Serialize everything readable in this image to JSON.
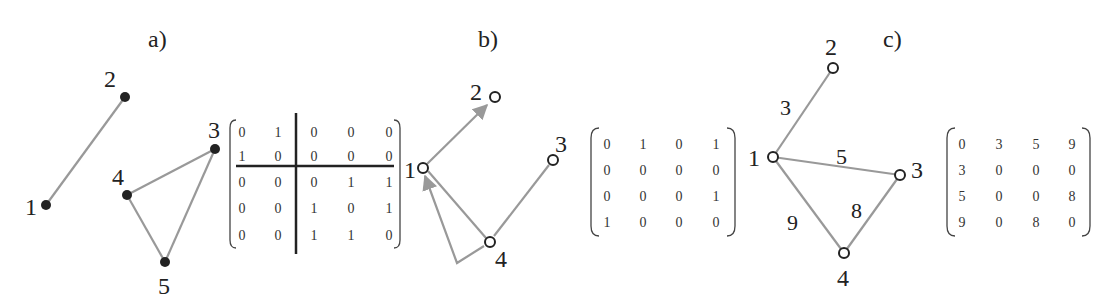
{
  "panels": [
    {
      "id": "a",
      "label": "a)",
      "graph_type": "undirected",
      "nodes": [
        {
          "id": "1",
          "label": "1"
        },
        {
          "id": "2",
          "label": "2"
        },
        {
          "id": "3",
          "label": "3"
        },
        {
          "id": "4",
          "label": "4"
        },
        {
          "id": "5",
          "label": "5"
        }
      ],
      "edges": [
        [
          "1",
          "2"
        ],
        [
          "4",
          "3"
        ],
        [
          "4",
          "5"
        ],
        [
          "3",
          "5"
        ]
      ],
      "matrix": [
        [
          "0",
          "1",
          "0",
          "0",
          "0"
        ],
        [
          "1",
          "0",
          "0",
          "0",
          "0"
        ],
        [
          "0",
          "0",
          "0",
          "1",
          "1"
        ],
        [
          "0",
          "0",
          "1",
          "0",
          "1"
        ],
        [
          "0",
          "0",
          "1",
          "1",
          "0"
        ]
      ],
      "matrix_note": "block-partitioned after row 2 and column 2"
    },
    {
      "id": "b",
      "label": "b)",
      "graph_type": "directed",
      "nodes": [
        {
          "id": "1",
          "label": "1"
        },
        {
          "id": "2",
          "label": "2"
        },
        {
          "id": "3",
          "label": "3"
        },
        {
          "id": "4",
          "label": "4"
        }
      ],
      "edges": [
        [
          "1",
          "2"
        ],
        [
          "1",
          "4"
        ],
        [
          "3",
          "4"
        ],
        [
          "4",
          "1"
        ]
      ],
      "matrix": [
        [
          "0",
          "1",
          "0",
          "1"
        ],
        [
          "0",
          "0",
          "0",
          "0"
        ],
        [
          "0",
          "0",
          "0",
          "1"
        ],
        [
          "1",
          "0",
          "0",
          "0"
        ]
      ]
    },
    {
      "id": "c",
      "label": "c)",
      "graph_type": "weighted",
      "nodes": [
        {
          "id": "1",
          "label": "1"
        },
        {
          "id": "2",
          "label": "2"
        },
        {
          "id": "3",
          "label": "3"
        },
        {
          "id": "4",
          "label": "4"
        }
      ],
      "edges": [
        {
          "from": "1",
          "to": "2",
          "weight": "3"
        },
        {
          "from": "1",
          "to": "3",
          "weight": "5"
        },
        {
          "from": "1",
          "to": "4",
          "weight": "9"
        },
        {
          "from": "3",
          "to": "4",
          "weight": "8"
        }
      ],
      "matrix": [
        [
          "0",
          "3",
          "5",
          "9"
        ],
        [
          "3",
          "0",
          "0",
          "0"
        ],
        [
          "5",
          "0",
          "0",
          "8"
        ],
        [
          "9",
          "0",
          "8",
          "0"
        ]
      ]
    }
  ]
}
